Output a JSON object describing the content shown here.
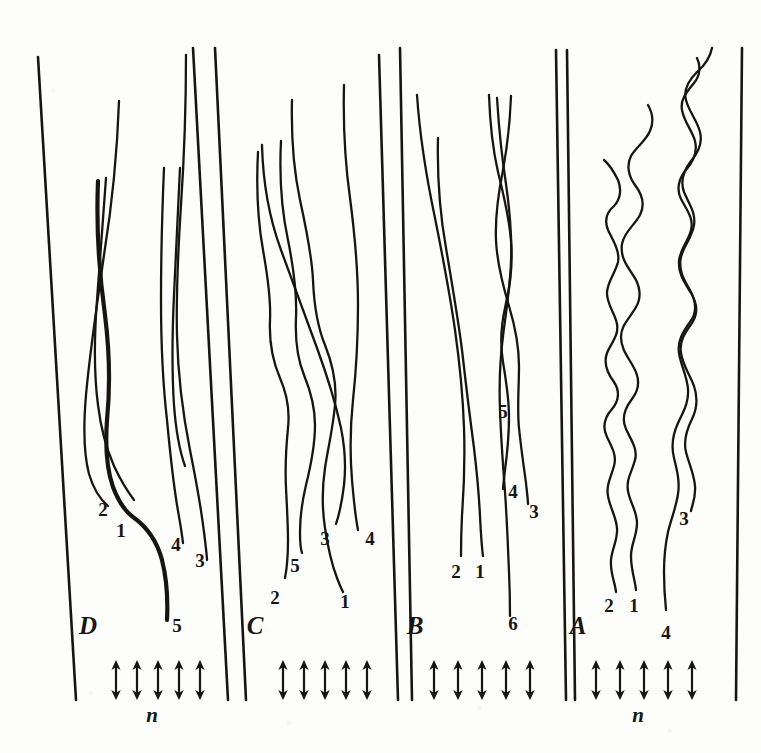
{
  "figure": {
    "kind": "scanned-plate",
    "background_color": "#fdfdfb",
    "ink_color": "#17150f",
    "panel_order": [
      "D",
      "C",
      "B",
      "A"
    ]
  },
  "panels": [
    {
      "id": "D",
      "letter": "D",
      "letter_x": 88,
      "letter_y": 634,
      "left_rule": {
        "x_top": 38,
        "x_bottom": 76,
        "y_top": 57,
        "y_bottom": 700
      },
      "right_rule": {
        "x_top": 193,
        "x_bottom": 228,
        "y_top": 48,
        "y_bottom": 700
      },
      "trace_character": "near-straight with gentle undulation",
      "traces": [
        {
          "label": "2",
          "label_x": 103,
          "label_y": 516,
          "d": "M119 101 C117 160, 112 205, 104 255 C97 305, 90 350, 86 395 C83 430, 84 455, 89 474 C94 491, 101 500, 108 506"
        },
        {
          "label": "1",
          "label_x": 121,
          "label_y": 537,
          "bold": true,
          "d": "M98 181 C96 230, 99 272, 105 315 C110 355, 110 390, 107 420 C105 448, 107 470, 113 487 C119 503, 126 512, 133 517 C147 527, 157 541, 162 560 C167 580, 168 600, 167 620"
        },
        {
          "label": "",
          "label_x": 0,
          "label_y": 0,
          "d": "M106 178 C103 222, 100 262, 97 300 C94 340, 94 375, 98 405 C101 430, 107 450, 114 466 C121 481, 128 492, 134 500"
        },
        {
          "label": "4",
          "label_x": 176,
          "label_y": 551,
          "d": "M164 168 C162 215, 161 258, 161 300 C161 345, 163 385, 167 420 C170 452, 173 480, 177 505 C180 522, 182 534, 183 543"
        },
        {
          "label": "3",
          "label_x": 200,
          "label_y": 567,
          "d": "M186 55 C186 110, 184 160, 181 205 C178 252, 176 295, 177 335 C178 378, 183 415, 190 450 C196 480, 201 508, 204 532 C206 548, 207 556, 207 560"
        },
        {
          "label": "5",
          "label_x": 177,
          "label_y": 632,
          "d": "M180 168 C178 215, 176 255, 174 295 C172 338, 172 375, 174 405 C176 432, 180 452, 185 466"
        }
      ],
      "arrows": {
        "count": 5,
        "x_positions": [
          116,
          137,
          158,
          179,
          200
        ],
        "y_top": 660,
        "y_bottom": 700
      },
      "n_label": {
        "text": "n",
        "x": 152,
        "y": 722
      }
    },
    {
      "id": "C",
      "letter": "C",
      "letter_x": 255,
      "letter_y": 634,
      "left_rule": {
        "x_top": 215,
        "x_bottom": 246,
        "y_top": 48,
        "y_bottom": 700
      },
      "right_rule": {
        "x_top": 379,
        "x_bottom": 398,
        "y_top": 55,
        "y_bottom": 700
      },
      "trace_character": "diagonal rightward drift with kinks",
      "traces": [
        {
          "label": "2",
          "label_x": 275,
          "label_y": 604,
          "d": "M258 152 C256 190, 258 222, 263 250 C268 278, 271 300, 270 320 C269 342, 273 362, 280 378 C287 394, 290 410, 288 428 C286 448, 285 468, 286 488 C287 508, 288 525, 288 540 C288 555, 287 568, 285 578"
        },
        {
          "label": "5",
          "label_x": 295,
          "label_y": 572,
          "d": "M281 141 C279 180, 282 212, 288 240 C294 270, 297 296, 296 318 C295 340, 298 360, 304 375 C311 392, 315 408, 315 425 C315 445, 311 465, 306 485 C302 502, 300 518, 300 532 C300 544, 301 550, 302 553"
        },
        {
          "label": "1",
          "label_x": 345,
          "label_y": 608,
          "d": "M292 100 C291 140, 294 172, 300 200 C307 232, 312 258, 313 280 C314 305, 318 328, 325 345 C333 365, 337 385, 335 405 C333 428, 328 448, 325 468 C322 488, 322 508, 325 528 C328 548, 332 565, 337 578 C340 586, 342 590, 343 592"
        },
        {
          "label": "3",
          "label_x": 325,
          "label_y": 545,
          "d": "M262 145 C263 185, 270 220, 281 250 C294 285, 306 318, 317 348 C328 378, 336 405, 341 428 C345 448, 346 467, 344 485 C342 502, 339 515, 336 524"
        },
        {
          "label": "4",
          "label_x": 370,
          "label_y": 545,
          "d": "M344 85 C343 125, 345 162, 350 198 C355 236, 358 272, 358 305 C358 340, 356 372, 353 400 C350 428, 350 455, 352 480 C354 503, 356 520, 358 530"
        }
      ],
      "arrows": {
        "count": 5,
        "x_positions": [
          283,
          304,
          325,
          346,
          367
        ],
        "y_top": 660,
        "y_bottom": 700
      },
      "n_label": null
    },
    {
      "id": "B",
      "letter": "B",
      "letter_x": 415,
      "letter_y": 634,
      "left_rule": {
        "x_top": 400,
        "x_bottom": 412,
        "y_top": 48,
        "y_bottom": 700
      },
      "right_rule": {
        "x_top": 556,
        "x_bottom": 566,
        "y_top": 50,
        "y_bottom": 700
      },
      "trace_character": "smooth long glides plus braided pair",
      "traces": [
        {
          "label": "2",
          "label_x": 456,
          "label_y": 578,
          "d": "M417 95 C420 140, 427 180, 435 218 C443 258, 450 295, 455 330 C460 365, 463 398, 464 428 C465 458, 464 488, 462 515 C461 535, 461 548, 461 556"
        },
        {
          "label": "1",
          "label_x": 480,
          "label_y": 578,
          "d": "M438 138 C437 178, 440 214, 446 248 C452 284, 458 318, 462 350 C466 385, 470 418, 474 448 C477 473, 479 496, 480 516 C481 536, 482 549, 483 556"
        },
        {
          "label": "4",
          "label_x": 513,
          "label_y": 498,
          "d": "M489 95 C490 125, 493 150, 498 172 C504 196, 509 218, 511 240 C513 265, 510 288, 505 308 C501 326, 500 344, 503 362 C506 380, 509 398, 509 416 C509 436, 507 455, 505 470 C504 480, 503 486, 503 489"
        },
        {
          "label": "3",
          "label_x": 534,
          "label_y": 518,
          "d": "M511 96 C510 124, 507 148, 503 170 C498 195, 495 218, 496 240 C497 264, 503 286, 509 306 C515 326, 519 346, 519 366 C519 388, 517 408, 519 428 C521 448, 524 468, 526 483 C527 493, 528 500, 528 504"
        },
        {
          "label": "6",
          "label_x": 513,
          "label_y": 630,
          "d": "M497 98 C499 130, 502 158, 506 184 C510 212, 512 238, 511 262 C510 288, 506 312, 503 336 C500 360, 499 385, 500 410 C501 438, 503 466, 505 492 C507 520, 508 548, 509 572 C510 594, 510 608, 510 616"
        }
      ],
      "mid_label": {
        "text": "5",
        "x": 503,
        "y": 418
      },
      "arrows": {
        "count": 5,
        "x_positions": [
          434,
          458,
          482,
          506,
          530
        ],
        "y_top": 660,
        "y_bottom": 700
      },
      "n_label": null
    },
    {
      "id": "A",
      "letter": "A",
      "letter_x": 578,
      "letter_y": 634,
      "left_rule": {
        "x_top": 567,
        "x_bottom": 575,
        "y_top": 50,
        "y_bottom": 700
      },
      "right_rule": {
        "x_top": 742,
        "x_bottom": 736,
        "y_top": 48,
        "y_bottom": 700
      },
      "trace_character": "strongly oscillating zigzag",
      "traces": [
        {
          "label": "2",
          "label_x": 609,
          "label_y": 612,
          "d": "M604 160 C610 165, 614 172, 618 180 C622 190, 620 200, 614 206 C607 212, 604 220, 608 230 C614 242, 620 252, 618 262 C615 274, 607 282, 607 293 C607 305, 615 313, 617 324 C619 336, 611 343, 607 353 C603 364, 608 374, 614 382 C620 391, 619 401, 612 409 C605 417, 602 427, 607 437 C612 447, 617 456, 614 466 C611 477, 606 485, 608 496 C610 508, 616 516, 617 528 C618 540, 612 548, 611 560 C610 573, 615 582, 616 592"
        },
        {
          "label": "1",
          "label_x": 634,
          "label_y": 612,
          "d": "M648 105 C652 112, 654 122, 650 131 C645 142, 636 147, 631 156 C626 166, 629 177, 635 185 C642 194, 645 205, 640 215 C634 226, 624 232, 622 244 C620 257, 627 266, 633 275 C640 285, 642 297, 636 307 C630 318, 621 325, 621 337 C621 350, 629 358, 634 368 C640 379, 639 390, 632 399 C625 408, 621 418, 626 429 C631 440, 638 449, 635 460 C632 472, 626 479, 628 491 C630 503, 637 511, 637 523 C637 536, 631 544, 631 556 C631 570, 635 580, 636 590"
        },
        {
          "label": "3",
          "label_x": 684,
          "label_y": 525,
          "d": "M697 58 C701 66, 700 76, 694 83 C687 92, 680 99, 682 110 C684 122, 692 130, 695 141 C698 153, 693 162, 686 170 C679 178, 676 189, 681 199 C687 210, 694 219, 691 230 C688 242, 680 249, 679 261 C678 274, 685 283, 691 293 C697 303, 698 314, 692 323 C685 333, 679 341, 681 353 C683 366, 690 375, 694 386 C698 398, 697 409, 692 419 C687 429, 683 440, 686 452 C689 464, 694 474, 695 486 C696 498, 692 505, 691 511"
        },
        {
          "label": "4",
          "label_x": 666,
          "label_y": 639,
          "d": "M712 48 C710 58, 704 66, 697 72 C689 80, 683 89, 686 100 C689 112, 697 120, 700 132 C703 144, 698 153, 691 161 C684 170, 680 181, 684 192 C689 204, 696 213, 694 225 C692 238, 684 245, 681 257 C678 270, 684 280, 690 290 C696 301, 697 313, 690 322 C683 332, 677 341, 679 353 C681 366, 687 376, 688 389 C689 403, 683 412, 678 423 C673 434, 671 446, 674 458 C677 470, 680 482, 678 494 C676 508, 671 519, 668 532 C665 546, 664 560, 664 572 C664 588, 665 600, 666 610"
        }
      ],
      "arrows": {
        "count": 5,
        "x_positions": [
          596,
          620,
          644,
          668,
          692
        ],
        "y_top": 660,
        "y_bottom": 700
      },
      "n_label": {
        "text": "n",
        "x": 638,
        "y": 722
      }
    }
  ]
}
